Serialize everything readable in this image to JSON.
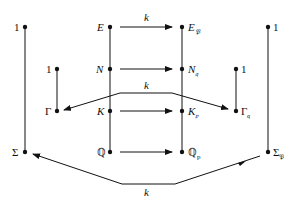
{
  "diagram": {
    "type": "field-extension-diagram",
    "colors": {
      "ink": "#111111",
      "background": "#ffffff"
    },
    "nodes": {
      "left_top": {
        "label": "1"
      },
      "left_bottom": {
        "label": "Σ"
      },
      "inner_left_top": {
        "label": "1"
      },
      "inner_left_bottom": {
        "label": "Γ"
      },
      "E": {
        "label": "E"
      },
      "N": {
        "label": "N"
      },
      "K": {
        "label": "K"
      },
      "Q": {
        "label": "ℚ"
      },
      "E_P": {
        "label": "E",
        "sub": "𝔓"
      },
      "N_q": {
        "label": "N",
        "sub": "𝔮"
      },
      "K_p": {
        "label": "K",
        "sub": "𝔭"
      },
      "Q_p": {
        "label": "ℚ",
        "sub": "p"
      },
      "inner_right_top": {
        "label": "1"
      },
      "inner_right_bottom": {
        "label": "Γ",
        "sub": "𝔮"
      },
      "right_top": {
        "label": "1"
      },
      "right_bottom": {
        "label": "Σ",
        "sub": "𝔓"
      }
    },
    "edge_labels": {
      "top_arrow": "k",
      "middle_arrow": "k",
      "bottom_arrow": "k"
    }
  }
}
